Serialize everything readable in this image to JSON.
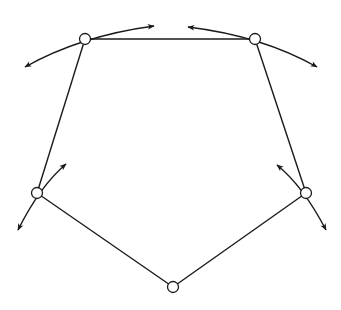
{
  "diagram": {
    "type": "pentagon-linkage",
    "stroke_color": "#1a1a1a",
    "background": "#ffffff",
    "nodes": [
      {
        "id": "top-left",
        "x": 85,
        "y": 39
      },
      {
        "id": "top-right",
        "x": 255,
        "y": 39
      },
      {
        "id": "right",
        "x": 306,
        "y": 193
      },
      {
        "id": "bottom",
        "x": 173,
        "y": 287
      },
      {
        "id": "left",
        "x": 37,
        "y": 193
      }
    ],
    "edges": [
      [
        "top-left",
        "top-right"
      ],
      [
        "top-right",
        "right"
      ],
      [
        "right",
        "bottom"
      ],
      [
        "bottom",
        "left"
      ],
      [
        "left",
        "top-left"
      ]
    ],
    "motion_arrows": [
      {
        "node": "top-left",
        "description": "double-headed curved arrow tangent at node",
        "from": [
          25,
          67
        ],
        "ctrl": [
          80,
          36
        ],
        "to": [
          154,
          26
        ]
      },
      {
        "node": "top-right",
        "description": "double-headed curved arrow tangent at node",
        "from": [
          188,
          27
        ],
        "ctrl": [
          262,
          36
        ],
        "to": [
          317,
          67
        ]
      },
      {
        "node": "left",
        "description": "double-headed arrow through node",
        "from": [
          18,
          230
        ],
        "ctrl": [
          40,
          186
        ],
        "to": [
          66,
          164
        ]
      },
      {
        "node": "right",
        "description": "double-headed arrow through node",
        "from": [
          277,
          165
        ],
        "ctrl": [
          303,
          186
        ],
        "to": [
          326,
          230
        ]
      }
    ]
  }
}
